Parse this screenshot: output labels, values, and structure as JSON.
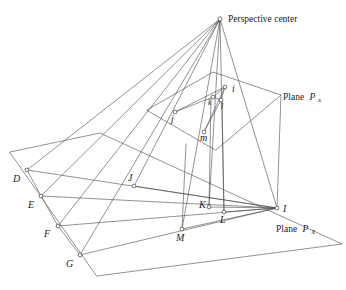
{
  "figure": {
    "background_color": "#ffffff",
    "line_color": "#4a4a4a",
    "label_color": "#1a1a1a"
  },
  "annotations": {
    "perspective_center": "Perspective center",
    "plane_image_prefix": "Plane",
    "plane_image_symbol": "P",
    "plane_image_subscript": "x",
    "plane_object_prefix": "Plane",
    "plane_object_symbol": "P",
    "plane_object_subscript": "X"
  },
  "points": {
    "perspective_center": {
      "label": "",
      "x": 220,
      "y": 19
    },
    "image_points": [
      {
        "label": "i",
        "x": 225,
        "y": 87,
        "lx": 232,
        "ly": 92
      },
      {
        "label": "j",
        "x": 175,
        "y": 112,
        "lx": 171,
        "ly": 122
      },
      {
        "label": "k",
        "x": 213,
        "y": 97,
        "lx": 208,
        "ly": 105
      },
      {
        "label": "l",
        "x": 221,
        "y": 100,
        "lx": 221,
        "ly": 109
      },
      {
        "label": "m",
        "x": 204,
        "y": 132,
        "lx": 200,
        "ly": 141
      }
    ],
    "object_points": [
      {
        "label": "D",
        "x": 27,
        "y": 170,
        "lx": 13,
        "ly": 182
      },
      {
        "label": "E",
        "x": 41,
        "y": 196,
        "lx": 28,
        "ly": 208
      },
      {
        "label": "F",
        "x": 58,
        "y": 226,
        "lx": 44,
        "ly": 237
      },
      {
        "label": "G",
        "x": 80,
        "y": 255,
        "lx": 66,
        "ly": 267
      },
      {
        "label": "J",
        "x": 134,
        "y": 186,
        "lx": 128,
        "ly": 181
      },
      {
        "label": "K",
        "x": 209,
        "y": 207,
        "lx": 199,
        "ly": 208
      },
      {
        "label": "L",
        "x": 224,
        "y": 212,
        "lx": 220,
        "ly": 223
      },
      {
        "label": "M",
        "x": 182,
        "y": 229,
        "lx": 176,
        "ly": 241
      },
      {
        "label": "I",
        "x": 277,
        "y": 208,
        "lx": 283,
        "ly": 212
      }
    ]
  },
  "geometry": {
    "plane_image_polygon": "147,110 213,72 281,95 216,150",
    "plane_object_polygon": "10,152 100,133 342,244 97,276",
    "rays": [
      "220,19 27,170",
      "220,19 41,196",
      "220,19 58,226",
      "220,19 80,255",
      "220,19 134,186",
      "220,19 209,207",
      "220,19 224,212",
      "220,19 182,229",
      "220,19 277,208"
    ],
    "object_rays_to_I": [
      "27,170 277,208",
      "41,196 277,208",
      "58,226 277,208",
      "80,255 277,208",
      "134,186 277,208",
      "209,207 277,208",
      "224,212 277,208",
      "182,229 277,208"
    ],
    "image_rays_to_i": [
      "175,112 225,87",
      "213,97 225,87",
      "221,100 225,87",
      "204,132 225,87"
    ],
    "object_chain": "27,170 41,196 58,226 80,255",
    "image_chain": "175,112 213,97 221,100 204,132"
  }
}
